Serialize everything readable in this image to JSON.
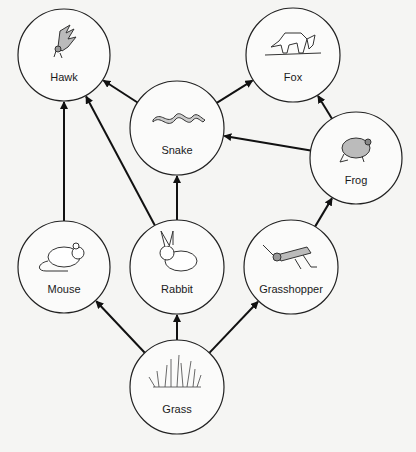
{
  "diagram": {
    "nodes": [
      {
        "id": "hawk",
        "label": "Hawk",
        "cx": 64,
        "cy": 55,
        "r": 46,
        "icon": "hawk-icon"
      },
      {
        "id": "fox",
        "label": "Fox",
        "cx": 293,
        "cy": 55,
        "r": 47,
        "icon": "fox-icon"
      },
      {
        "id": "snake",
        "label": "Snake",
        "cx": 177,
        "cy": 128,
        "r": 47,
        "icon": "snake-icon"
      },
      {
        "id": "frog",
        "label": "Frog",
        "cx": 356,
        "cy": 158,
        "r": 46,
        "icon": "frog-icon"
      },
      {
        "id": "mouse",
        "label": "Mouse",
        "cx": 64,
        "cy": 267,
        "r": 46,
        "icon": "mouse-icon"
      },
      {
        "id": "rabbit",
        "label": "Rabbit",
        "cx": 177,
        "cy": 267,
        "r": 47,
        "icon": "rabbit-icon"
      },
      {
        "id": "grasshopper",
        "label": "Grasshopper",
        "cx": 291,
        "cy": 267,
        "r": 47,
        "icon": "grasshopper-icon"
      },
      {
        "id": "grass",
        "label": "Grass",
        "cx": 177,
        "cy": 387,
        "r": 47,
        "icon": "grass-icon"
      }
    ],
    "edges": [
      {
        "from": "grass",
        "to": "mouse"
      },
      {
        "from": "grass",
        "to": "rabbit"
      },
      {
        "from": "grass",
        "to": "grasshopper"
      },
      {
        "from": "mouse",
        "to": "hawk"
      },
      {
        "from": "rabbit",
        "to": "hawk"
      },
      {
        "from": "rabbit",
        "to": "snake"
      },
      {
        "from": "snake",
        "to": "hawk"
      },
      {
        "from": "snake",
        "to": "fox"
      },
      {
        "from": "frog",
        "to": "fox"
      },
      {
        "from": "frog",
        "to": "snake"
      },
      {
        "from": "grasshopper",
        "to": "frog"
      }
    ]
  }
}
